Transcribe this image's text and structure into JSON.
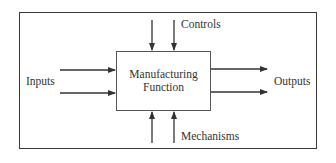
{
  "diagram": {
    "type": "IDEF0 function block",
    "process": {
      "line1": "Manufacturing",
      "line2": "Function"
    },
    "labels": {
      "inputs": "Inputs",
      "outputs": "Outputs",
      "controls": "Controls",
      "mechanisms": "Mechanisms"
    },
    "arrows": {
      "inputs_count": 2,
      "outputs_count": 2,
      "controls_count": 2,
      "mechanisms_count": 2
    },
    "colors": {
      "line": "#333333",
      "background": "#ffffff"
    }
  }
}
